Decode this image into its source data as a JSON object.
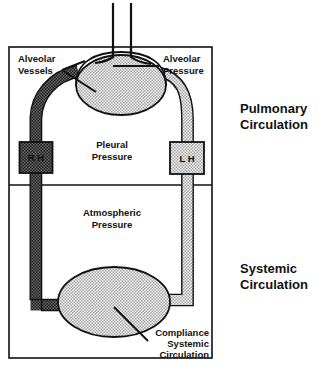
{
  "figure": {
    "type": "schematic-diagram"
  },
  "labels": {
    "alveolar_vessels": {
      "line1": "Alveolar",
      "line2": "Vessels"
    },
    "alveolar_pressure": {
      "line1": "Alveolar",
      "line2": "Pressure"
    },
    "pleural_pressure": {
      "line1": "Pleural",
      "line2": "Pressure"
    },
    "atmospheric_pressure": {
      "line1": "Atmospheric",
      "line2": "Pressure"
    },
    "compliance_systemic": {
      "line1": "Compliance",
      "line2": "Systemic",
      "line3": "Circulation"
    },
    "pulmonary_circulation": {
      "line1": "Pulmonary",
      "line2": "Circulation"
    },
    "systemic_circulation": {
      "line1": "Systemic",
      "line2": "Circulation"
    },
    "right_heart": "R H",
    "left_heart": "L H"
  },
  "colors": {
    "outline": "#111111",
    "background": "#ffffff",
    "stipple_light": "#c9c9c9",
    "stipple_dark": "#3a3a3a",
    "text": "#111111"
  },
  "components": {
    "chamber_box": "thoracic-chamber",
    "trachea": "airway-tube",
    "lung": "alveolar-compartment",
    "systemic_compliance": "systemic-compliance-vessel",
    "pulmonary_artery": "dark-vessel-right-heart-to-lung",
    "pulmonary_vein": "light-vessel-lung-to-left-heart",
    "divider": "pleural-atmospheric-divider"
  }
}
